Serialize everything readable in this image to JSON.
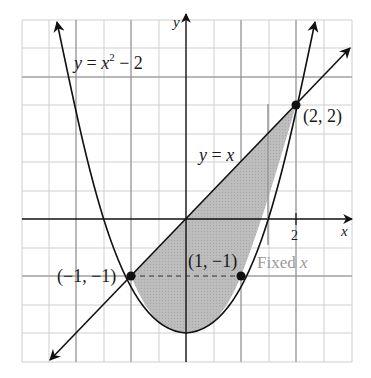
{
  "figure": {
    "curves": {
      "parabola_label": "y = x² − 2",
      "parabola_label_parts": {
        "y": "y",
        "eq": " = ",
        "x": "x",
        "exp": "2",
        "rest": " − 2"
      },
      "line_label_parts": {
        "y": "y",
        "eq": " = ",
        "x": "x"
      },
      "line_label": "y = x"
    },
    "axes": {
      "x_label": "x",
      "y_label": "y",
      "x_tick_label": "2"
    },
    "points": [
      {
        "label": "(−1, −1)",
        "x": -1,
        "y": -1
      },
      {
        "label": "(1, −1)",
        "x": 1,
        "y": -1
      },
      {
        "label": "(2, 2)",
        "x": 2,
        "y": 2
      }
    ],
    "annotation": {
      "fixed_x_label_text": "Fixed ",
      "fixed_x_label_var": "x"
    },
    "colors": {
      "curve": "#111111",
      "shade": "#b4b4b4",
      "grid": "#c8c8c8",
      "annotation": "#9a9a9a"
    }
  }
}
